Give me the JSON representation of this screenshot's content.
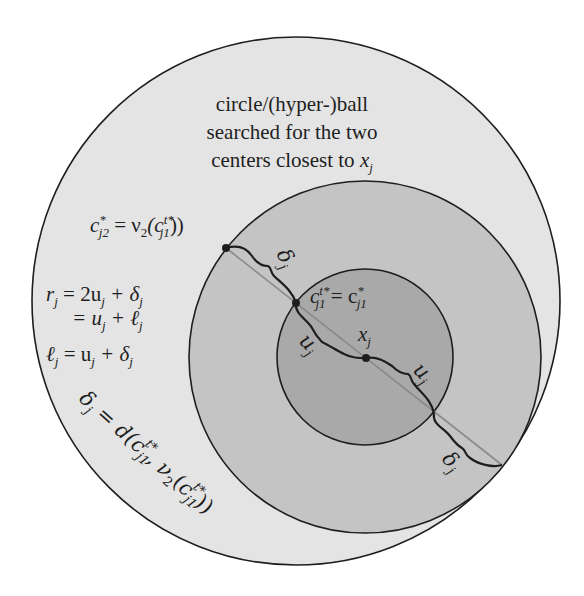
{
  "title_lines": [
    "circle/(hyper-)ball",
    "searched for the two",
    "centers closest to "
  ],
  "title_var": "x",
  "title_var_sub": "j",
  "labels": {
    "c_j2": {
      "base": "c",
      "sup": "*",
      "sub": "j2",
      "rhs": " = ν",
      "rhs_sub": "2",
      "rhs_arg_base": "(c",
      "rhs_arg_sup": "t*",
      "rhs_arg_sub": "j1",
      "close": "))"
    },
    "r_line1": {
      "lhs": "r",
      "lhs_sub": "j",
      "rhs": " = 2u",
      "rhs_sub1": "j",
      "rhs2": " + δ",
      "rhs_sub2": "j"
    },
    "r_line2": {
      "rhs": "= u",
      "rhs_sub1": "j",
      "rhs2": " + ℓ",
      "rhs_sub2": "j"
    },
    "l_line": {
      "lhs": "ℓ",
      "lhs_sub": "j",
      "rhs": " = u",
      "rhs_sub1": "j",
      "rhs2": " + δ",
      "rhs_sub2": "j"
    },
    "delta_def": "δj = d(cj1t*, ν2(cj1t*))",
    "c_j1": {
      "base": "c",
      "sup": "t*",
      "sub": "j1",
      "eq": " = c",
      "eq_sup": "*",
      "eq_sub": "j1"
    },
    "x_j": {
      "base": "x",
      "sub": "j"
    },
    "u_j_left": "uj",
    "u_j_right": "uj",
    "delta_top": "δj",
    "delta_bottom": "δj"
  },
  "geometry": {
    "outer_circle": {
      "cx": 296,
      "cy": 301,
      "r": 264,
      "fill": "#e4e4e4"
    },
    "middle_circle": {
      "cx": 365,
      "cy": 357,
      "r": 176,
      "fill": "#c4c4c4"
    },
    "inner_circle": {
      "cx": 365,
      "cy": 357,
      "r": 88,
      "fill": "#a9a9a9"
    },
    "points": {
      "c_j2": [
        226,
        248
      ],
      "c_j1": [
        296,
        303
      ],
      "x_j": [
        366,
        358
      ],
      "inner_lower": [
        434,
        414
      ],
      "middle_lower": [
        502,
        465
      ]
    }
  },
  "colors": {
    "stroke": "#1e1e1e",
    "diameter_line": "#8a8a8a"
  }
}
